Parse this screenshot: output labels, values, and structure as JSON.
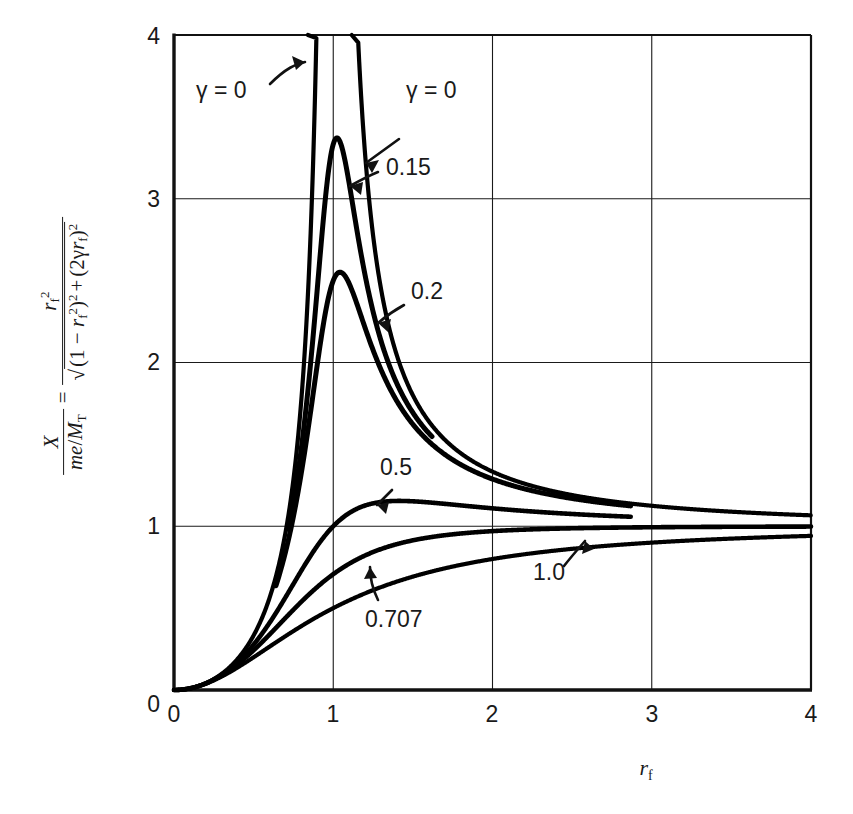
{
  "figure": {
    "kind": "engineering-frequency-response-chart",
    "background": "#ffffff",
    "ink": "#000000"
  },
  "axes": {
    "x_title_main": "r",
    "x_title_sub": "f",
    "x_ticks": [
      "0",
      "1",
      "2",
      "3",
      "4"
    ],
    "y_ticks": [
      "0",
      "1",
      "2",
      "3",
      "4"
    ],
    "y_label_parts": {
      "num_main": "X",
      "den_me": "me",
      "den_slash": "/",
      "den_M": "M",
      "den_M_sub": "T",
      "equals": "=",
      "rhs_num_r": "r",
      "rhs_num_sub": "f",
      "rhs_num_sup": "2",
      "radical": "√",
      "rhs_den_open": "(1 − ",
      "rhs_den_r": "r",
      "rhs_den_sub": "f",
      "rhs_den_sup2": "2",
      "rhs_den_close": ")",
      "rhs_den_pow": "2",
      "plus": "+",
      "rhs_den2_open": "(2",
      "gamma": "γ",
      "rhs_den2_r": "r",
      "rhs_den2_sub": "f",
      "rhs_den2_close": ")",
      "rhs_den2_pow": "2"
    }
  },
  "curve_labels": [
    {
      "id": "gamma0-left",
      "text": "γ = 0",
      "x": 196,
      "y": 98
    },
    {
      "id": "gamma0-right",
      "text": "γ = 0",
      "x": 388,
      "y": 98
    },
    {
      "id": "g015",
      "text": "0.15",
      "x": 386,
      "y": 175
    },
    {
      "id": "g02",
      "text": "0.2",
      "x": 411,
      "y": 299
    },
    {
      "id": "g05",
      "text": "0.5",
      "x": 380,
      "y": 475
    },
    {
      "id": "g0707",
      "text": "0.707",
      "x": 365,
      "y": 613
    },
    {
      "id": "g10",
      "text": "1.0",
      "x": 540,
      "y": 576
    }
  ],
  "chart_data": {
    "type": "line",
    "title": "",
    "xlabel": "r_f",
    "ylabel": "X/(me/M_T) = r_f^2 / sqrt((1-r_f^2)^2 + (2*gamma*r_f)^2)",
    "xlim": [
      0,
      4
    ],
    "ylim": [
      0,
      4
    ],
    "xticks": [
      0,
      1,
      2,
      3,
      4
    ],
    "yticks": [
      0,
      1,
      2,
      3,
      4
    ],
    "grid": true,
    "legend": "inline-curve-labels",
    "equation": "X/(me/M_T) = r_f^2 / sqrt((1 - r_f^2)^2 + (2 g r_f)^2)",
    "series": [
      {
        "name": "γ = 0",
        "gamma": 0,
        "x_start": 0.0,
        "x_end": 4.0,
        "asymptote_at": 1.0,
        "peak_value": null,
        "value_at_4": 1.07,
        "note": "undamped; diverges at r_f = 1, two branches"
      },
      {
        "name": "0.15",
        "gamma": 0.15,
        "x_start": 0.72,
        "x_end": 1.62,
        "peak_x": 1.03,
        "peak_value": 3.3,
        "note": "partial arc drawn around resonance peak"
      },
      {
        "name": "0.2",
        "gamma": 0.2,
        "x_start": 0.64,
        "x_end": 2.87,
        "peak_x": 1.06,
        "peak_value": 2.48,
        "value_at_end": 1.13
      },
      {
        "name": "0.5",
        "gamma": 0.5,
        "x_start": 0.0,
        "x_end": 2.87,
        "peak_x": 1.63,
        "peak_value": 1.16,
        "value_at_end": 1.12
      },
      {
        "name": "0.707",
        "gamma": 0.707,
        "x_start": 0.0,
        "x_end": 4.0,
        "peak_value": null,
        "value_at_4": 1.0,
        "note": "critically flat, monotonic to 1"
      },
      {
        "name": "1.0",
        "gamma": 1.0,
        "x_start": 0.0,
        "x_end": 4.0,
        "peak_value": null,
        "value_at_4": 0.92,
        "note": "monotonic, approaches 1 from below"
      }
    ]
  }
}
